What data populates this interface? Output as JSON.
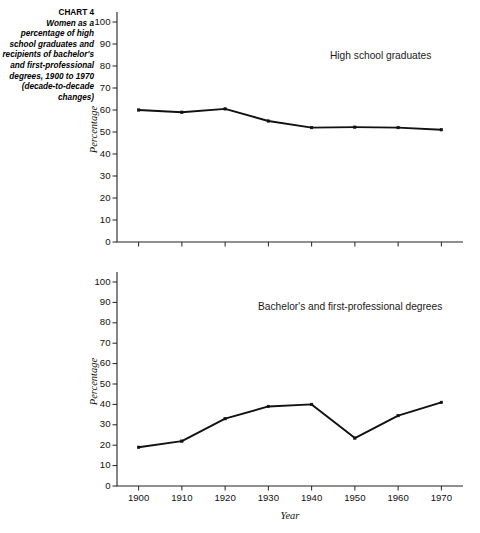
{
  "caption": {
    "chart_number": "CHART 4",
    "description": "Women as a percentage of high school graduates and recipients of bachelor's and first-professional degrees, 1900 to 1970  (decade-to-decade changes)"
  },
  "chart_data": [
    {
      "type": "line",
      "panel": "top",
      "title": "",
      "annotation": "High school graduates",
      "xlabel": "",
      "ylabel": "Percentage",
      "x": [
        1900,
        1910,
        1920,
        1930,
        1940,
        1950,
        1960,
        1970
      ],
      "categories": [
        "1900",
        "1910",
        "1920",
        "1930",
        "1940",
        "1950",
        "1960",
        "1970"
      ],
      "values": [
        60,
        59,
        60.5,
        55,
        52,
        52.2,
        52,
        51
      ],
      "xlim": [
        1895,
        1975
      ],
      "ylim": [
        0,
        100
      ],
      "yticks": [
        0,
        10,
        20,
        30,
        40,
        50,
        60,
        70,
        80,
        90,
        100
      ],
      "ytick_labels": [
        "0",
        "10",
        "20",
        "30",
        "40",
        "50",
        "60",
        "70",
        "80",
        "90",
        "100"
      ],
      "xtick_labels_visible": false,
      "grid": false,
      "marker": "square",
      "line_color": "#111111"
    },
    {
      "type": "line",
      "panel": "bottom",
      "title": "",
      "annotation": "Bachelor's and first-professional degrees",
      "xlabel": "Year",
      "ylabel": "Percentage",
      "x": [
        1900,
        1910,
        1920,
        1930,
        1940,
        1950,
        1960,
        1970
      ],
      "categories": [
        "1900",
        "1910",
        "1920",
        "1930",
        "1940",
        "1950",
        "1960",
        "1970"
      ],
      "values": [
        19,
        22,
        33,
        39,
        40,
        23.5,
        34.5,
        41
      ],
      "xlim": [
        1895,
        1975
      ],
      "ylim": [
        0,
        100
      ],
      "yticks": [
        0,
        10,
        20,
        30,
        40,
        50,
        60,
        70,
        80,
        90,
        100
      ],
      "ytick_labels": [
        "0",
        "10",
        "20",
        "30",
        "40",
        "50",
        "60",
        "70",
        "80",
        "90",
        "100"
      ],
      "xtick_labels_visible": true,
      "grid": false,
      "marker": "square",
      "line_color": "#111111"
    }
  ],
  "colors": {
    "background": "#ffffff",
    "axis": "#222222",
    "line": "#111111",
    "text": "#111111"
  }
}
